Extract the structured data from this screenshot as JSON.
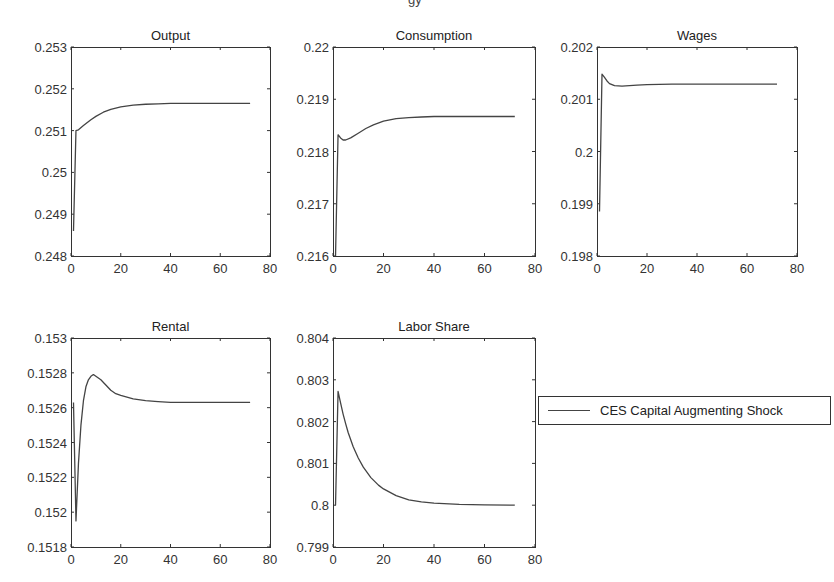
{
  "figure": {
    "title_fragment": "gy"
  },
  "legend": {
    "label": "CES Capital Augmenting Shock",
    "placement": "right of bottom row"
  },
  "chart_data": [
    {
      "type": "line",
      "title": "Output",
      "xlabel": "",
      "ylabel": "",
      "xlim": [
        0,
        80
      ],
      "ylim": [
        0.248,
        0.253
      ],
      "xticks": [
        0,
        20,
        40,
        60,
        80
      ],
      "xtick_labels": [
        "0",
        "20",
        "40",
        "60",
        "80"
      ],
      "yticks": [
        0.248,
        0.249,
        0.25,
        0.251,
        0.252,
        0.253
      ],
      "ytick_labels": [
        "0.248",
        "0.249",
        "0.25",
        "0.251",
        "0.252",
        "0.253"
      ],
      "grid": false,
      "series": [
        {
          "name": "CES Capital Augmenting Shock",
          "x": [
            1,
            2,
            3,
            5,
            8,
            10,
            13,
            16,
            20,
            25,
            30,
            35,
            40,
            50,
            60,
            72
          ],
          "y": [
            0.2486,
            0.251,
            0.25102,
            0.25112,
            0.25126,
            0.25134,
            0.25144,
            0.25151,
            0.25157,
            0.25161,
            0.25163,
            0.25164,
            0.25165,
            0.25165,
            0.25165,
            0.25165
          ]
        }
      ]
    },
    {
      "type": "line",
      "title": "Consumption",
      "xlabel": "",
      "ylabel": "",
      "xlim": [
        0,
        80
      ],
      "ylim": [
        0.216,
        0.22
      ],
      "xticks": [
        0,
        20,
        40,
        60,
        80
      ],
      "xtick_labels": [
        "0",
        "20",
        "40",
        "60",
        "80"
      ],
      "yticks": [
        0.216,
        0.217,
        0.218,
        0.219,
        0.22
      ],
      "ytick_labels": [
        "0.216",
        "0.217",
        "0.218",
        "0.219",
        "0.22"
      ],
      "grid": false,
      "series": [
        {
          "name": "CES Capital Augmenting Shock",
          "x": [
            1,
            2,
            3,
            4,
            5,
            7,
            10,
            13,
            16,
            20,
            25,
            30,
            35,
            40,
            50,
            60,
            72
          ],
          "y": [
            0.216,
            0.21832,
            0.21826,
            0.21822,
            0.21822,
            0.21826,
            0.21835,
            0.21844,
            0.21851,
            0.21858,
            0.21863,
            0.21865,
            0.21866,
            0.21867,
            0.21867,
            0.21867,
            0.21867
          ]
        }
      ]
    },
    {
      "type": "line",
      "title": "Wages",
      "xlabel": "",
      "ylabel": "",
      "xlim": [
        0,
        80
      ],
      "ylim": [
        0.198,
        0.202
      ],
      "xticks": [
        0,
        20,
        40,
        60,
        80
      ],
      "xtick_labels": [
        "0",
        "20",
        "40",
        "60",
        "80"
      ],
      "yticks": [
        0.198,
        0.199,
        0.2,
        0.201,
        0.202
      ],
      "ytick_labels": [
        "0.198",
        "0.199",
        "0.2",
        "0.201",
        "0.202"
      ],
      "grid": false,
      "series": [
        {
          "name": "CES Capital Augmenting Shock",
          "x": [
            1,
            2,
            3,
            4,
            5,
            7,
            10,
            13,
            16,
            20,
            30,
            40,
            50,
            60,
            72
          ],
          "y": [
            0.19885,
            0.20148,
            0.20142,
            0.20135,
            0.2013,
            0.20126,
            0.20125,
            0.20126,
            0.20127,
            0.20128,
            0.20129,
            0.20129,
            0.20129,
            0.20129,
            0.20129
          ]
        }
      ]
    },
    {
      "type": "line",
      "title": "Rental",
      "xlabel": "",
      "ylabel": "",
      "xlim": [
        0,
        80
      ],
      "ylim": [
        0.1518,
        0.153
      ],
      "xticks": [
        0,
        20,
        40,
        60,
        80
      ],
      "xtick_labels": [
        "0",
        "20",
        "40",
        "60",
        "80"
      ],
      "yticks": [
        0.1518,
        0.152,
        0.1522,
        0.1524,
        0.1526,
        0.1528,
        0.153
      ],
      "ytick_labels": [
        "0.1518",
        "0.152",
        "0.1522",
        "0.1524",
        "0.1526",
        "0.1528",
        "0.153"
      ],
      "grid": false,
      "series": [
        {
          "name": "CES Capital Augmenting Shock",
          "x": [
            1,
            2,
            3,
            4,
            5,
            6,
            7,
            8,
            9,
            10,
            12,
            14,
            16,
            18,
            20,
            25,
            30,
            35,
            40,
            50,
            60,
            72
          ],
          "y": [
            0.15263,
            0.15195,
            0.15228,
            0.1525,
            0.15264,
            0.15272,
            0.15276,
            0.15278,
            0.15279,
            0.15278,
            0.15276,
            0.15273,
            0.1527,
            0.15268,
            0.15267,
            0.15265,
            0.15264,
            0.152635,
            0.15263,
            0.15263,
            0.15263,
            0.15263
          ]
        }
      ]
    },
    {
      "type": "line",
      "title": "Labor Share",
      "xlabel": "",
      "ylabel": "",
      "xlim": [
        0,
        80
      ],
      "ylim": [
        0.799,
        0.804
      ],
      "xticks": [
        0,
        20,
        40,
        60,
        80
      ],
      "xtick_labels": [
        "0",
        "20",
        "40",
        "60",
        "80"
      ],
      "yticks": [
        0.799,
        0.8,
        0.801,
        0.802,
        0.803,
        0.804
      ],
      "ytick_labels": [
        "0.799",
        "0.8",
        "0.801",
        "0.802",
        "0.803",
        "0.804"
      ],
      "grid": false,
      "series": [
        {
          "name": "CES Capital Augmenting Shock",
          "x": [
            1,
            2,
            3,
            4,
            5,
            6,
            8,
            10,
            12,
            15,
            18,
            20,
            25,
            30,
            35,
            40,
            50,
            60,
            72
          ],
          "y": [
            0.8,
            0.80272,
            0.80245,
            0.80218,
            0.80195,
            0.80174,
            0.8014,
            0.80113,
            0.80091,
            0.80066,
            0.80048,
            0.80039,
            0.80023,
            0.80013,
            0.80008,
            0.80005,
            0.80002,
            0.80001,
            0.8
          ]
        }
      ]
    }
  ]
}
